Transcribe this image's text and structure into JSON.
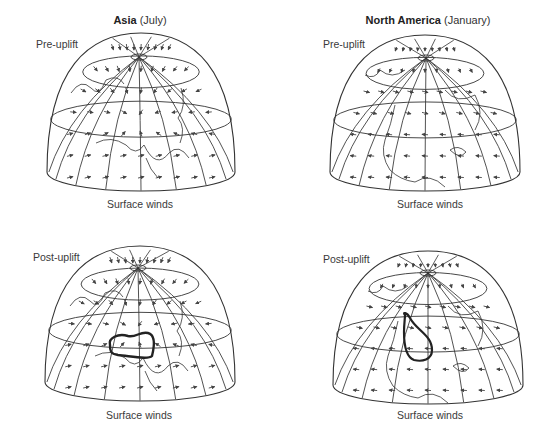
{
  "figure": {
    "columns": [
      {
        "region_bold": "Asia",
        "season": "(July)"
      },
      {
        "region_bold": "North America",
        "season": "(January)"
      }
    ],
    "panels": [
      {
        "id": "asia-pre",
        "state_label": "Pre-uplift",
        "caption": "Surface winds",
        "plateau_outline": false
      },
      {
        "id": "na-pre",
        "state_label": "Pre-uplift",
        "caption": "Surface winds",
        "plateau_outline": false
      },
      {
        "id": "asia-post",
        "state_label": "Post-uplift",
        "caption": "Surface winds",
        "plateau_outline": true
      },
      {
        "id": "na-post",
        "state_label": "Post-uplift",
        "caption": "Surface winds",
        "plateau_outline": true
      }
    ],
    "colors": {
      "line": "#333333",
      "arrow": "#444444",
      "plateau": "#222222",
      "text": "#333333"
    }
  }
}
